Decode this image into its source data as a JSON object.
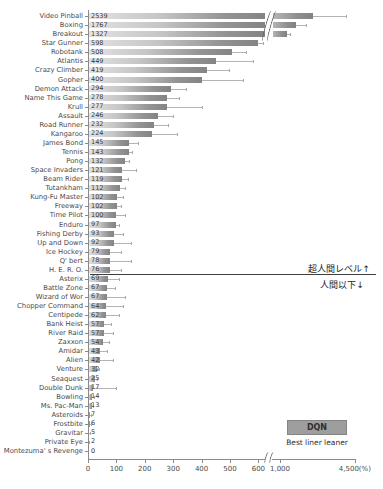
{
  "legend": {
    "dqn_label": "DQN",
    "linear_label": "Best liner leaner"
  },
  "chart_data": {
    "type": "bar",
    "orientation": "horizontal",
    "title": "",
    "xlabel": "",
    "ylabel": "",
    "unit": "%",
    "axis": {
      "pre_break_ticks": [
        {
          "label": "0",
          "value": 0
        },
        {
          "label": "100",
          "value": 100
        },
        {
          "label": "200",
          "value": 200
        },
        {
          "label": "300",
          "value": 300
        },
        {
          "label": "400",
          "value": 400
        },
        {
          "label": "500",
          "value": 500
        },
        {
          "label": "600",
          "value": 600
        }
      ],
      "axis_break_after": 600,
      "post_break_ticks": [
        {
          "label": "1,000",
          "value": 1000
        },
        {
          "label": "4,500(%)",
          "value": 4500
        }
      ],
      "grid": false
    },
    "annotations": {
      "above": "超人間レベル↑",
      "below": "人間以下↓",
      "line_between": [
        "H. E. R. O.",
        "Asterix"
      ]
    },
    "series": [
      {
        "name": "DQN",
        "style": "bar"
      },
      {
        "name": "Best liner leaner",
        "style": "line"
      }
    ],
    "games": [
      {
        "label": "Video Pinball",
        "dqn": 2539,
        "linear": 4100
      },
      {
        "label": "Boxing",
        "dqn": 1767,
        "linear": 2200
      },
      {
        "label": "Breakout",
        "dqn": 1327,
        "linear": 1450
      },
      {
        "label": "Star Gunner",
        "dqn": 598,
        "linear": 615
      },
      {
        "label": "Robotank",
        "dqn": 508,
        "linear": 555
      },
      {
        "label": "Atlantis",
        "dqn": 449,
        "linear": 580
      },
      {
        "label": "Crazy Climber",
        "dqn": 419,
        "linear": 495
      },
      {
        "label": "Gopher",
        "dqn": 400,
        "linear": 545
      },
      {
        "label": "Demon Attack",
        "dqn": 294,
        "linear": 345
      },
      {
        "label": "Name This Game",
        "dqn": 278,
        "linear": 320
      },
      {
        "label": "Krull",
        "dqn": 277,
        "linear": 400
      },
      {
        "label": "Assault",
        "dqn": 246,
        "linear": 300
      },
      {
        "label": "Road Runner",
        "dqn": 232,
        "linear": 280
      },
      {
        "label": "Kangaroo",
        "dqn": 224,
        "linear": 315
      },
      {
        "label": "James Bond",
        "dqn": 145,
        "linear": 175
      },
      {
        "label": "Tennis",
        "dqn": 143,
        "linear": 155
      },
      {
        "label": "Pong",
        "dqn": 132,
        "linear": 145
      },
      {
        "label": "Space Invaders",
        "dqn": 121,
        "linear": 170
      },
      {
        "label": "Beam Rider",
        "dqn": 119,
        "linear": 140
      },
      {
        "label": "Tutankham",
        "dqn": 112,
        "linear": 130
      },
      {
        "label": "Kung-Fu Master",
        "dqn": 102,
        "linear": 122
      },
      {
        "label": "Freeway",
        "dqn": 102,
        "linear": 115
      },
      {
        "label": "Time Pilot",
        "dqn": 100,
        "linear": 130
      },
      {
        "label": "Enduro",
        "dqn": 97,
        "linear": 110
      },
      {
        "label": "Fishing Derby",
        "dqn": 93,
        "linear": 122
      },
      {
        "label": "Up and Down",
        "dqn": 92,
        "linear": 150
      },
      {
        "label": "Ice Hockey",
        "dqn": 79,
        "linear": 115
      },
      {
        "label": "Q' bert",
        "dqn": 78,
        "linear": 150
      },
      {
        "label": "H. E. R. O.",
        "dqn": 76,
        "linear": 115
      },
      {
        "label": "Asterix",
        "dqn": 69,
        "linear": 108
      },
      {
        "label": "Battle Zone",
        "dqn": 67,
        "linear": 95
      },
      {
        "label": "Wizard of Wor",
        "dqn": 67,
        "linear": 130
      },
      {
        "label": "Chopper Command",
        "dqn": 64,
        "linear": 122
      },
      {
        "label": "Centipede",
        "dqn": 62,
        "linear": 110
      },
      {
        "label": "Bank Heist",
        "dqn": 57,
        "linear": 80
      },
      {
        "label": "River Raid",
        "dqn": 57,
        "linear": 88
      },
      {
        "label": "Zaxxon",
        "dqn": 54,
        "linear": 74
      },
      {
        "label": "Amidar",
        "dqn": 43,
        "linear": 67
      },
      {
        "label": "Alien",
        "dqn": 42,
        "linear": 88
      },
      {
        "label": "Venture",
        "dqn": 32,
        "linear": 40
      },
      {
        "label": "Seaquest",
        "dqn": 25,
        "linear": 30
      },
      {
        "label": "Double Dunk",
        "dqn": 17,
        "linear": 98
      },
      {
        "label": "Bowling",
        "dqn": 14,
        "linear": 20
      },
      {
        "label": "Ms. Pac-Man",
        "dqn": 13,
        "linear": 18
      },
      {
        "label": "Asteroids",
        "dqn": 7,
        "linear": 10
      },
      {
        "label": "Frostbite",
        "dqn": 6,
        "linear": 9
      },
      {
        "label": "Gravitar",
        "dqn": 5,
        "linear": 8
      },
      {
        "label": "Private Eye",
        "dqn": 2,
        "linear": 4
      },
      {
        "label": "Montezuma' s Revenge",
        "dqn": 0,
        "linear": 0
      }
    ]
  }
}
